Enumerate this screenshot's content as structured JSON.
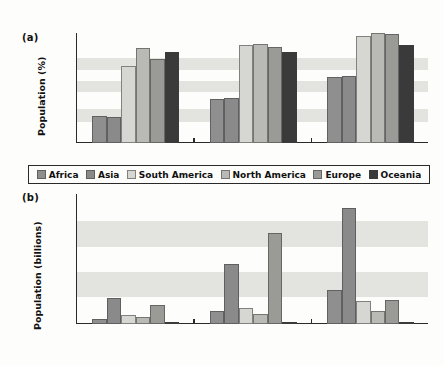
{
  "figure": {
    "panel_a_tag": "(a)",
    "panel_b_tag": "(b)",
    "xlabel": "Year",
    "background": "#fdfdfb",
    "band_color": "#e3e3e0",
    "axis_color": "#2a2a2a"
  },
  "legend": {
    "items": [
      {
        "label": "Africa",
        "color": "#8f8f8f"
      },
      {
        "label": "Asia",
        "color": "#8a8a8a"
      },
      {
        "label": "South America",
        "color": "#d6d6d2"
      },
      {
        "label": "North America",
        "color": "#b9b9b5"
      },
      {
        "label": "Europe",
        "color": "#9a9a97"
      },
      {
        "label": "Oceania",
        "color": "#3a3a3a"
      }
    ]
  },
  "chart_data": [
    {
      "type": "bar",
      "panel": "(a)",
      "title": "",
      "xlabel": "Year",
      "ylabel": "Population (%)",
      "categories": [
        "1975",
        "2000",
        "2025"
      ],
      "ylim": [
        0,
        80
      ],
      "yticks": [
        0,
        20,
        40,
        60,
        80
      ],
      "ytick_labels": [
        "0",
        "20",
        "40",
        "60",
        "80"
      ],
      "grid": false,
      "banded_background": true,
      "legend_position": "below",
      "series": [
        {
          "name": "Africa",
          "values": [
            20,
            32,
            48
          ]
        },
        {
          "name": "Asia",
          "values": [
            19,
            32.5,
            48.5
          ]
        },
        {
          "name": "South America",
          "values": [
            56,
            71,
            78
          ]
        },
        {
          "name": "North America",
          "values": [
            69,
            72,
            80
          ]
        },
        {
          "name": "Europe",
          "values": [
            61,
            70,
            79
          ]
        },
        {
          "name": "Oceania",
          "values": [
            66,
            66,
            71
          ]
        }
      ]
    },
    {
      "type": "bar",
      "panel": "(b)",
      "title": "",
      "xlabel": "Year",
      "ylabel": "Population (billions)",
      "categories": [
        "1975",
        "2000",
        "2025"
      ],
      "ylim": [
        0,
        3.0
      ],
      "yticks": [
        0,
        0.5,
        1.0,
        1.5,
        2.0,
        2.5,
        3.0
      ],
      "ytick_labels": [
        "0",
        "0.5",
        "1.0",
        "1.5",
        "2.0",
        "2.5",
        "3.0"
      ],
      "grid": false,
      "banded_background": true,
      "legend_position": "shared-above",
      "series": [
        {
          "name": "Africa",
          "values": [
            0.11,
            0.29,
            0.79
          ]
        },
        {
          "name": "Asia",
          "values": [
            0.6,
            1.39,
            2.67
          ]
        },
        {
          "name": "South America",
          "values": [
            0.2,
            0.38,
            0.53
          ]
        },
        {
          "name": "North America",
          "values": [
            0.17,
            0.23,
            0.29
          ]
        },
        {
          "name": "Europe",
          "values": [
            0.45,
            2.09,
            0.56
          ]
        },
        {
          "name": "Oceania",
          "values": [
            0.02,
            0.02,
            0.02
          ]
        }
      ]
    }
  ]
}
